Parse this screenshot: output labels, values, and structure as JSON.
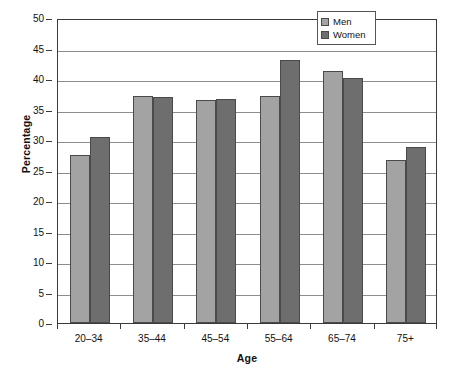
{
  "chart_data": {
    "type": "bar",
    "title": "",
    "xlabel": "Age",
    "ylabel": "Percentage",
    "categories": [
      "20–34",
      "35–44",
      "45–54",
      "55–64",
      "65–74",
      "75+"
    ],
    "series": [
      {
        "name": "Men",
        "color": "#a3a3a3",
        "values": [
          27.5,
          37.2,
          36.5,
          37.2,
          41.3,
          26.7
        ]
      },
      {
        "name": "Women",
        "color": "#6e6e6e",
        "values": [
          30.5,
          37.1,
          36.8,
          43.1,
          40.1,
          28.8
        ]
      }
    ],
    "ylim": [
      0,
      50
    ],
    "ytick_step": 5,
    "yticks": [
      "0",
      "5",
      "10",
      "15",
      "20",
      "25",
      "30",
      "35",
      "40",
      "45",
      "50"
    ],
    "grid": "horizontal",
    "legend_position": "top-right",
    "legend_entries": [
      "Men",
      "Women"
    ]
  }
}
